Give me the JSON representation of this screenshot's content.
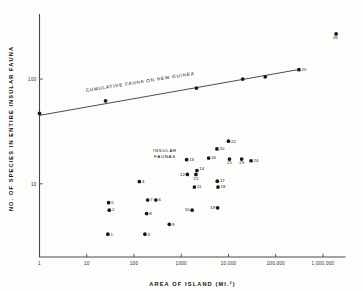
{
  "chart_data": {
    "type": "scatter",
    "title": "",
    "xlabel": "AREA OF ISLAND (MI.2)",
    "xlabel_main": "AREA OF ISLAND (MI.",
    "xlabel_sup": "2",
    "xlabel_close": ")",
    "ylabel": "NO. OF SPECIES IN ENTIRE INSULAR FAUNA",
    "xscale": "log",
    "yscale": "log",
    "xlim": [
      1,
      3000000
    ],
    "ylim": [
      2,
      400
    ],
    "grid": false,
    "legend": null,
    "xticks": [
      1,
      10,
      100,
      1000,
      10000,
      100000,
      1000000
    ],
    "xticklabels": [
      "1",
      "10",
      "100",
      "1000",
      "10,000",
      "100,000",
      "1,000,000"
    ],
    "yticks": [
      10,
      100
    ],
    "yticklabels": [
      "10",
      "100"
    ],
    "annotations": [
      {
        "name": "cumulative-fauna-line-label",
        "text": "CUMULATIVE FAUNA ON NEW GUINEA",
        "rotation": -9
      },
      {
        "name": "insular-faunas-label-line1",
        "text": "INSULAR"
      },
      {
        "name": "insular-faunas-label-line2",
        "text": "FAUNAS"
      }
    ],
    "series": [
      {
        "name": "insular-faunas",
        "marker": "filled-circle",
        "color": "#161616",
        "points": [
          {
            "label": "1",
            "x": 28,
            "y": 3.3
          },
          {
            "label": "2",
            "x": 30,
            "y": 5.6
          },
          {
            "label": "3",
            "x": 170,
            "y": 3.3
          },
          {
            "label": "4",
            "x": 130,
            "y": 10.5
          },
          {
            "label": "5",
            "x": 29,
            "y": 6.6
          },
          {
            "label": "6",
            "x": 290,
            "y": 7.0
          },
          {
            "label": "7",
            "x": 195,
            "y": 7.0
          },
          {
            "label": "8",
            "x": 185,
            "y": 5.2
          },
          {
            "label": "9",
            "x": 560,
            "y": 4.1
          },
          {
            "label": "10",
            "x": 1700,
            "y": 5.6
          },
          {
            "label": "11",
            "x": 1900,
            "y": 9.3
          },
          {
            "label": "12",
            "x": 1350,
            "y": 12.3
          },
          {
            "label": "13",
            "x": 1300,
            "y": 17.0
          },
          {
            "label": "14",
            "x": 2150,
            "y": 13.4
          },
          {
            "label": "15",
            "x": 2050,
            "y": 12.3
          },
          {
            "label": "16",
            "x": 3800,
            "y": 17.6
          },
          {
            "label": "17",
            "x": 5800,
            "y": 10.6
          },
          {
            "label": "18",
            "x": 6000,
            "y": 9.3
          },
          {
            "label": "19",
            "x": 5900,
            "y": 5.9
          },
          {
            "label": "20",
            "x": 5700,
            "y": 21.5
          },
          {
            "label": "21",
            "x": 10500,
            "y": 17.2
          },
          {
            "label": "22",
            "x": 10000,
            "y": 25.5
          },
          {
            "label": "23",
            "x": 19000,
            "y": 17.2
          },
          {
            "label": "24",
            "x": 30000,
            "y": 16.6
          }
        ]
      },
      {
        "name": "cumulative-fauna-on-new-guinea",
        "marker": "filled-circle",
        "color": "#161616",
        "points": [
          {
            "label": "",
            "x": 1,
            "y": 47
          },
          {
            "label": "",
            "x": 25,
            "y": 62
          },
          {
            "label": "",
            "x": 2100,
            "y": 82
          },
          {
            "label": "",
            "x": 20000,
            "y": 100
          },
          {
            "label": "",
            "x": 60000,
            "y": 105
          },
          {
            "label": "25",
            "x": 310000,
            "y": 123
          },
          {
            "label": "26",
            "x": 1900000,
            "y": 270
          }
        ]
      }
    ],
    "fit_line": {
      "name": "cumulative-fauna-line",
      "x_start": 1,
      "y_start": 45,
      "x_end": 330000,
      "y_end": 124
    }
  }
}
